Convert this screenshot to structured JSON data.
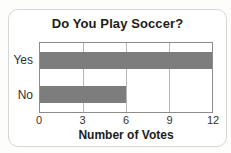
{
  "chart_data": {
    "type": "bar",
    "orientation": "horizontal",
    "title": "Do You Play Soccer?",
    "categories": [
      "Yes",
      "No"
    ],
    "values": [
      12,
      6
    ],
    "xlabel": "Number of Votes",
    "ylabel": "",
    "xticks": [
      "0",
      "3",
      "6",
      "9",
      "12"
    ],
    "xlim": [
      0,
      12
    ],
    "grid": true,
    "gridline_positions_pct": [
      25,
      50,
      75
    ],
    "bar_color": "#7d7d7d",
    "plot_border_color": "#8c8c8c",
    "legend": "none"
  }
}
